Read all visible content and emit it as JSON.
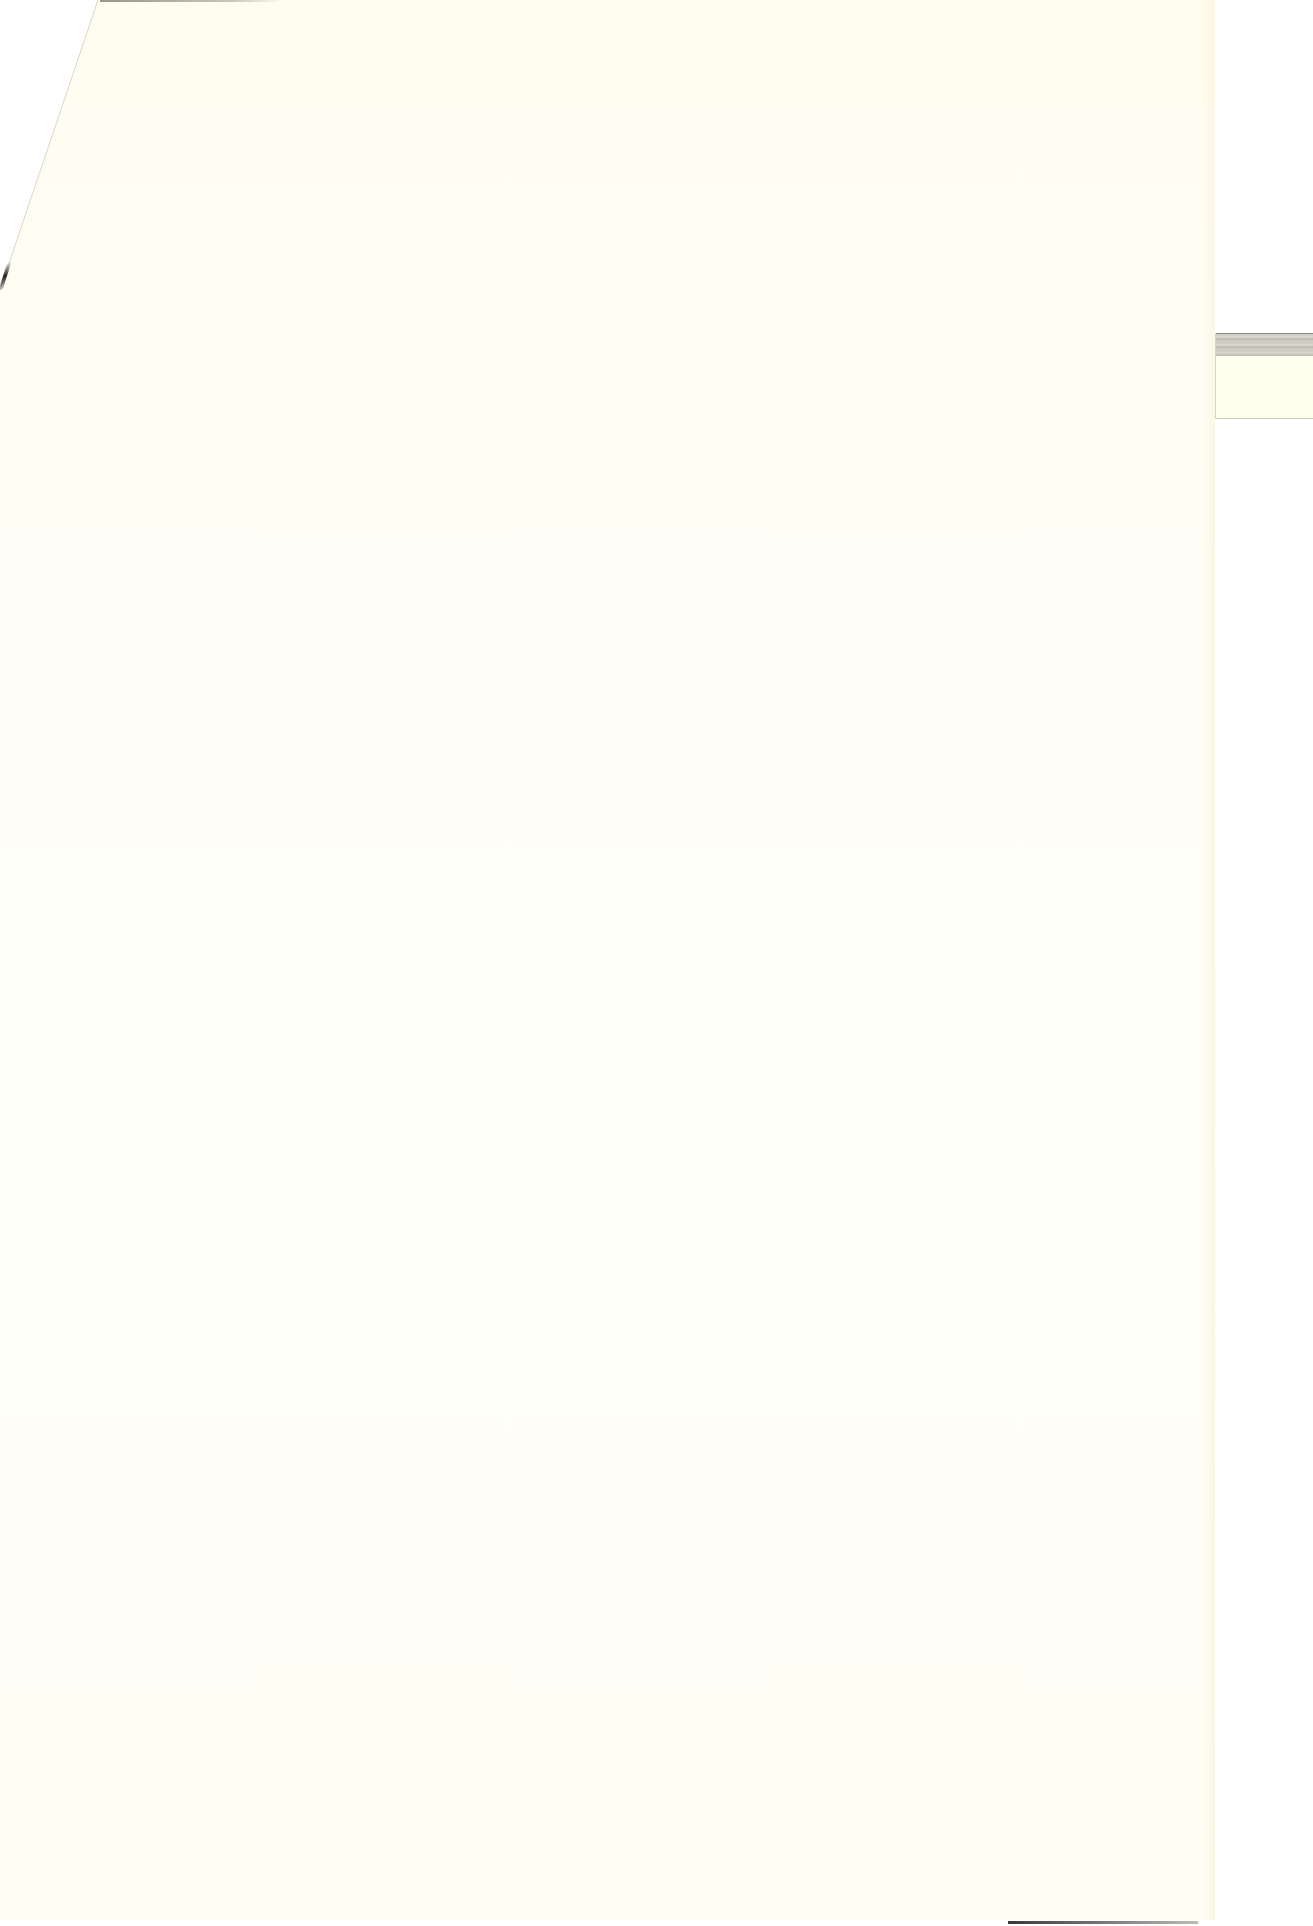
{
  "document": {
    "type": "scanned-paper-page",
    "content": "",
    "paper_color": "#fffdf2",
    "tab_color": "#fffff0"
  }
}
